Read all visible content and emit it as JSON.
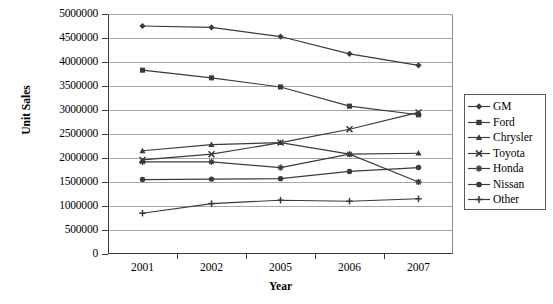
{
  "chart_data": {
    "type": "line",
    "title": "",
    "xlabel": "Year",
    "ylabel": "Unit Sales",
    "categories": [
      "2001",
      "2002",
      "2005",
      "2006",
      "2007"
    ],
    "x": [
      2001,
      2002,
      2005,
      2006,
      2007
    ],
    "ylim": [
      0,
      5000000
    ],
    "ytick_labels": [
      "5000000",
      "4500000",
      "4000000",
      "3500000",
      "3000000",
      "2500000",
      "2000000",
      "1500000",
      "1000000",
      "500000",
      "0"
    ],
    "ytick_values": [
      5000000,
      4500000,
      4000000,
      3500000,
      3000000,
      2500000,
      2000000,
      1500000,
      1000000,
      500000,
      0
    ],
    "ytick_step": 500000,
    "grid": true,
    "legend_position": "right",
    "series": [
      {
        "name": "GM",
        "marker": "diamond",
        "values": [
          4750000,
          4720000,
          4530000,
          4170000,
          3930000
        ]
      },
      {
        "name": "Ford",
        "marker": "square",
        "values": [
          3830000,
          3670000,
          3480000,
          3080000,
          2900000
        ]
      },
      {
        "name": "Chrysler",
        "marker": "triangle",
        "values": [
          2150000,
          2280000,
          2320000,
          2080000,
          2100000
        ]
      },
      {
        "name": "Toyota",
        "marker": "cross",
        "values": [
          1960000,
          2080000,
          2320000,
          2600000,
          2950000
        ]
      },
      {
        "name": "Honda",
        "marker": "star",
        "values": [
          1920000,
          1920000,
          1800000,
          2080000,
          1500000
        ]
      },
      {
        "name": "Nissan",
        "marker": "circle",
        "values": [
          1550000,
          1560000,
          1570000,
          1720000,
          1800000
        ]
      },
      {
        "name": "Other",
        "marker": "plus",
        "values": [
          850000,
          1050000,
          1120000,
          1100000,
          1150000
        ]
      }
    ]
  },
  "legend": {
    "items": [
      {
        "label": "GM"
      },
      {
        "label": "Ford"
      },
      {
        "label": "Chrysler"
      },
      {
        "label": "Toyota"
      },
      {
        "label": "Honda"
      },
      {
        "label": "Nissan"
      },
      {
        "label": "Other"
      }
    ]
  },
  "colors": {
    "line": "#3a3a3a",
    "grid": "#a6a6a6",
    "axis": "#3a3a3a",
    "background": "#ffffff"
  }
}
